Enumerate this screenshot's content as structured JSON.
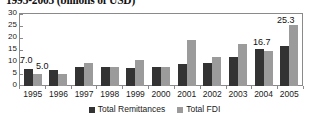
{
  "chart_data": {
    "type": "bar",
    "title": "1995-2005 (billions of USD)",
    "xlabel": "",
    "ylabel": "",
    "ylim": [
      0,
      30
    ],
    "yticks": [
      0,
      5,
      10,
      15,
      20,
      25,
      30
    ],
    "grid": false,
    "legend_position": "bottom",
    "categories": [
      "1995",
      "1996",
      "1997",
      "1998",
      "1999",
      "2000",
      "2001",
      "2002",
      "2003",
      "2004",
      "2005"
    ],
    "series": [
      {
        "name": "Total Remittances",
        "color": "#333333",
        "values": [
          7.0,
          6.5,
          7.8,
          7.8,
          7.6,
          8.0,
          9.0,
          9.5,
          12.0,
          15.3,
          16.7
        ]
      },
      {
        "name": "Total FDI",
        "color": "#9b9b9b",
        "values": [
          5.0,
          5.0,
          9.5,
          7.8,
          10.8,
          8.0,
          19.0,
          12.0,
          17.7,
          14.5,
          25.3
        ]
      }
    ],
    "annotations": [
      {
        "text": "7.0",
        "series": "Total Remittances",
        "category": "1995"
      },
      {
        "text": "5.0",
        "series": "Total FDI",
        "category": "1995"
      },
      {
        "text": "16.7",
        "series": "Total Remittances",
        "category": "2005"
      },
      {
        "text": "25.3",
        "series": "Total FDI",
        "category": "2005"
      }
    ]
  },
  "labels": {
    "y": [
      "30",
      "25",
      "20",
      "15",
      "10",
      "5",
      "0"
    ],
    "value_7_0": "7.0",
    "value_5_0": "5.0",
    "value_16_7": "16.7",
    "value_25_3": "25.3"
  }
}
